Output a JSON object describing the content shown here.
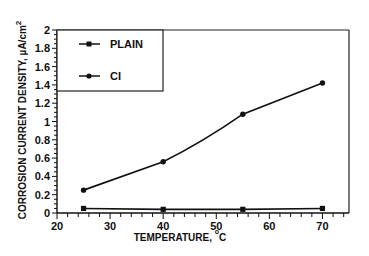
{
  "chart_data": {
    "type": "line",
    "title": "",
    "xlabel": "TEMPERATURE, °C",
    "ylabel": "CORROSION CURRENT DENSITY, µA/cm²",
    "x": [
      25,
      40,
      55,
      70
    ],
    "series": [
      {
        "name": "PLAIN",
        "marker": "square",
        "values": [
          0.05,
          0.04,
          0.04,
          0.05
        ]
      },
      {
        "name": "CI",
        "marker": "circle",
        "values": [
          0.25,
          0.56,
          1.08,
          1.42
        ]
      }
    ],
    "xlim": [
      20,
      75
    ],
    "ylim": [
      0,
      2
    ],
    "x_ticks": [
      "20",
      "30",
      "40",
      "50",
      "60",
      "70"
    ],
    "y_ticks": [
      "0",
      "0.2",
      "0.4",
      "0.6",
      "0.8",
      "1",
      "1.2",
      "1.4",
      "1.6",
      "1.8",
      "2"
    ],
    "grid": false,
    "legend_position": "upper-left (boxed)"
  },
  "labels": {
    "xlabel_main": "TEMPERATURE, ",
    "xlabel_degree": "o",
    "xlabel_unit": "C",
    "ylabel_main": "CORROSION CURRENT DENSITY,  µA/cm",
    "ylabel_sup": "2",
    "legend_plain": "PLAIN",
    "legend_ci": "CI"
  }
}
